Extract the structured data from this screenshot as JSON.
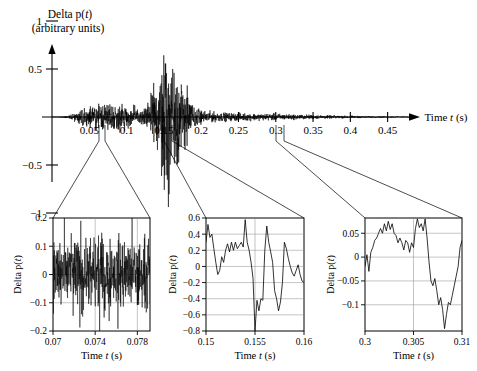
{
  "figure": {
    "main": {
      "title_line1": "Delta p(t)",
      "title_line2": "(arbitrary units)",
      "xlabel": "Time t (s)",
      "xticks": [
        "0.05",
        "0.1",
        "0.15",
        "0.2",
        "0.25",
        "0.3",
        "0.35",
        "0.4",
        "0.45"
      ],
      "yticks": [
        "1",
        "0.5",
        "−0.5",
        "−1"
      ]
    },
    "insets": [
      {
        "name": "inset-one",
        "ylabel": "Delta p(t)",
        "xlabel": "Time t (s)",
        "yticks": [
          "0.2",
          "0.1",
          "0",
          "−0.1",
          "−0.2"
        ],
        "xticks": [
          "0.07",
          "0.074",
          "0.078"
        ]
      },
      {
        "name": "inset-two",
        "ylabel": "Delta p(t)",
        "xlabel": "Time t (s)",
        "yticks": [
          "0.6",
          "0.4",
          "0.2",
          "0",
          "−0.2",
          "−0.4",
          "−0.6",
          "−0.8"
        ],
        "xticks": [
          "0.15",
          "0.155",
          "0.16"
        ]
      },
      {
        "name": "inset-three",
        "ylabel": "Delta p(t)",
        "xlabel": "Time t (s)",
        "yticks": [
          "0.05",
          "0",
          "−0.05",
          "−0.1"
        ],
        "xticks": [
          "0.3",
          "0.305",
          "0.31"
        ]
      }
    ]
  },
  "chart_data": {
    "type": "line",
    "xlabel": "Time t (s)",
    "ylabel": "Delta p(t) (arbitrary units)",
    "grid": false,
    "legend": "none",
    "xlim": [
      0,
      0.48
    ],
    "ylim": [
      -1.25,
      1.25
    ],
    "xticks": [
      0.05,
      0.1,
      0.15,
      0.2,
      0.25,
      0.3,
      0.35,
      0.4,
      0.45
    ],
    "yticks": [
      -1,
      -0.5,
      0,
      0.5,
      1
    ],
    "envelope": {
      "t": [
        0.0,
        0.01,
        0.02,
        0.03,
        0.04,
        0.05,
        0.06,
        0.07,
        0.08,
        0.09,
        0.1,
        0.11,
        0.12,
        0.13,
        0.135,
        0.14,
        0.145,
        0.15,
        0.155,
        0.16,
        0.165,
        0.17,
        0.175,
        0.18,
        0.185,
        0.19,
        0.2,
        0.22,
        0.24,
        0.26,
        0.28,
        0.3,
        0.32,
        0.34,
        0.36,
        0.38,
        0.4,
        0.42,
        0.44,
        0.46,
        0.48
      ],
      "amplitude": [
        0.004,
        0.006,
        0.02,
        0.06,
        0.11,
        0.15,
        0.17,
        0.19,
        0.2,
        0.2,
        0.19,
        0.15,
        0.11,
        0.22,
        0.5,
        0.62,
        0.78,
        0.95,
        1.1,
        0.86,
        1.05,
        0.72,
        0.6,
        0.42,
        0.26,
        0.16,
        0.1,
        0.07,
        0.06,
        0.055,
        0.05,
        0.05,
        0.04,
        0.035,
        0.028,
        0.022,
        0.018,
        0.014,
        0.011,
        0.008,
        0.006
      ]
    },
    "insets": [
      {
        "type": "line",
        "title": "inset-one",
        "xlabel": "Time t (s)",
        "ylabel": "Delta p(t)",
        "xlim": [
          0.07,
          0.0792
        ],
        "ylim": [
          -0.2,
          0.2
        ],
        "xticks": [
          0.07,
          0.074,
          0.078
        ],
        "yticks": [
          -0.2,
          -0.1,
          0,
          0.1,
          0.2
        ],
        "grid": true,
        "description": "Dense high-frequency oscillation filling the full -0.2 to 0.2 band."
      },
      {
        "type": "line",
        "title": "inset-two",
        "xlabel": "Time t (s)",
        "ylabel": "Delta p(t)",
        "xlim": [
          0.15,
          0.16
        ],
        "ylim": [
          -0.8,
          0.6
        ],
        "xticks": [
          0.15,
          0.155,
          0.16
        ],
        "yticks": [
          -0.8,
          -0.6,
          -0.4,
          -0.2,
          0,
          0.2,
          0.4,
          0.6
        ],
        "grid": true,
        "x": [
          0.15,
          0.1502,
          0.1504,
          0.1506,
          0.1508,
          0.151,
          0.1512,
          0.1514,
          0.1516,
          0.1518,
          0.152,
          0.1522,
          0.1524,
          0.1526,
          0.1528,
          0.153,
          0.1532,
          0.1534,
          0.1536,
          0.1538,
          0.154,
          0.1542,
          0.1544,
          0.1546,
          0.1548,
          0.155,
          0.1552,
          0.1554,
          0.1556,
          0.1558,
          0.156,
          0.1562,
          0.1564,
          0.1566,
          0.1568,
          0.157,
          0.1572,
          0.1574,
          0.1576,
          0.1578,
          0.158,
          0.1582,
          0.1584,
          0.1586,
          0.1588,
          0.159,
          0.1592,
          0.1594,
          0.1596,
          0.1598,
          0.16
        ],
        "y": [
          0.3,
          0.52,
          0.36,
          0.4,
          0.22,
          0.05,
          -0.1,
          -0.05,
          0.12,
          0.05,
          0.2,
          0.28,
          0.18,
          0.3,
          0.2,
          0.3,
          0.22,
          0.26,
          0.3,
          0.24,
          0.58,
          0.3,
          0.2,
          0.05,
          -0.15,
          -0.8,
          -0.42,
          -0.55,
          -0.4,
          -0.42,
          0.2,
          0.5,
          0.3,
          0.18,
          0.05,
          -0.3,
          -0.4,
          -0.55,
          -0.44,
          -0.2,
          0.3,
          0.22,
          0.1,
          0.0,
          -0.08,
          -0.12,
          -0.05,
          0.02,
          -0.1,
          -0.18,
          -0.2
        ]
      },
      {
        "type": "line",
        "title": "inset-three",
        "xlabel": "Time t (s)",
        "ylabel": "Delta p(t)",
        "xlim": [
          0.3,
          0.31
        ],
        "ylim": [
          -0.155,
          0.082
        ],
        "xticks": [
          0.3,
          0.305,
          0.31
        ],
        "yticks": [
          -0.1,
          -0.05,
          0,
          0.05
        ],
        "grid": true,
        "x": [
          0.3,
          0.3002,
          0.3004,
          0.3006,
          0.3008,
          0.301,
          0.3012,
          0.3014,
          0.3016,
          0.3018,
          0.302,
          0.3022,
          0.3024,
          0.3026,
          0.3028,
          0.303,
          0.3032,
          0.3034,
          0.3036,
          0.3038,
          0.304,
          0.3042,
          0.3044,
          0.3046,
          0.3048,
          0.305,
          0.3052,
          0.3054,
          0.3056,
          0.3058,
          0.306,
          0.3062,
          0.3064,
          0.3066,
          0.3068,
          0.307,
          0.3072,
          0.3074,
          0.3076,
          0.3078,
          0.308,
          0.3082,
          0.3084,
          0.3086,
          0.3088,
          0.309,
          0.3092,
          0.3094,
          0.3096,
          0.3098,
          0.31
        ],
        "y": [
          -0.02,
          0.005,
          -0.03,
          0.01,
          0.02,
          0.035,
          0.04,
          0.05,
          0.06,
          0.05,
          0.07,
          0.055,
          0.075,
          0.058,
          0.07,
          0.05,
          0.045,
          0.03,
          0.04,
          0.03,
          0.015,
          0.035,
          0.03,
          0.01,
          0.03,
          0.02,
          0.06,
          0.08,
          0.062,
          0.07,
          0.055,
          0.08,
          0.04,
          -0.01,
          -0.05,
          -0.06,
          -0.045,
          -0.07,
          -0.1,
          -0.085,
          -0.11,
          -0.15,
          -0.12,
          -0.095,
          -0.1,
          -0.08,
          -0.06,
          -0.04,
          -0.02,
          0.02,
          0.035
        ]
      }
    ]
  }
}
